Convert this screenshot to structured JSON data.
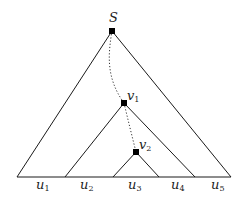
{
  "diagram": {
    "root": {
      "label": "S",
      "x": 112,
      "y": 31,
      "label_x": 109,
      "label_y": 22
    },
    "nodes": [
      {
        "id": "v1",
        "label": "v",
        "sub": "1",
        "x": 124,
        "y": 103,
        "label_x": 127,
        "label_y": 100
      },
      {
        "id": "v2",
        "label": "v",
        "sub": "2",
        "x": 136,
        "y": 152,
        "label_x": 139,
        "label_y": 149
      }
    ],
    "baseline": {
      "x1": 17,
      "x2": 231,
      "y": 177
    },
    "triangles": [
      {
        "id": "outer",
        "apex": [
          112,
          31
        ],
        "left": [
          17,
          177
        ],
        "right": [
          231,
          177
        ]
      },
      {
        "id": "middle",
        "apex": [
          124,
          103
        ],
        "left": [
          65,
          177
        ],
        "right": [
          195,
          177
        ]
      },
      {
        "id": "inner",
        "apex": [
          136,
          152
        ],
        "left": [
          113,
          177
        ],
        "right": [
          159,
          177
        ]
      }
    ],
    "path": [
      {
        "from": "S",
        "to": "v1",
        "d": "M112,31 C108,55 106,78 124,103"
      },
      {
        "from": "v1",
        "to": "v2",
        "d": "M124,103 C128,120 132,136 136,152"
      }
    ],
    "intervals": [
      {
        "label": "u",
        "sub": "1",
        "x": 36,
        "y": 189
      },
      {
        "label": "u",
        "sub": "2",
        "x": 80,
        "y": 189
      },
      {
        "label": "u",
        "sub": "3",
        "x": 128,
        "y": 189
      },
      {
        "label": "u",
        "sub": "4",
        "x": 171,
        "y": 189
      },
      {
        "label": "u",
        "sub": "5",
        "x": 211,
        "y": 189
      }
    ]
  }
}
